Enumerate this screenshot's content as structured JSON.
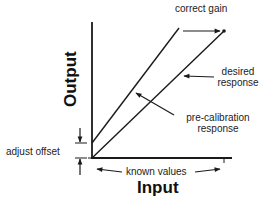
{
  "diagram": {
    "type": "calibration-gain-offset",
    "axes": {
      "x_label": "Input",
      "y_label": "Output"
    },
    "lines": [
      {
        "name": "desired response",
        "from": [
          92,
          158
        ],
        "to": [
          224,
          31
        ],
        "endpoint_dot": true
      },
      {
        "name": "pre-calibration response",
        "from": [
          92,
          143
        ],
        "to": [
          179,
          28
        ]
      }
    ],
    "labels": {
      "correct_gain": "correct gain",
      "desired_line1": "desired",
      "desired_line2": "response",
      "precal_line1": "pre-calibration",
      "precal_line2": "response",
      "adjust_offset": "adjust offset",
      "known_values": "known values"
    },
    "colors": {
      "ink": "#1a1a1a",
      "background": "#ffffff"
    }
  }
}
